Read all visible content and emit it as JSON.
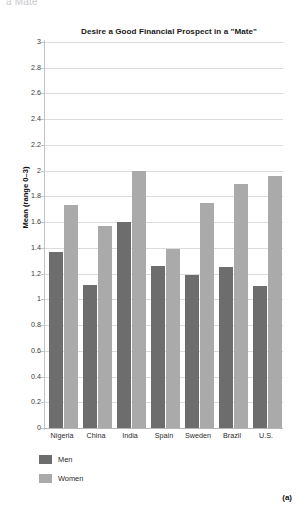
{
  "figure": {
    "cutoff_text": "a Mate",
    "panel_label": "(a)"
  },
  "legend": {
    "position": "bottom-left",
    "items": [
      {
        "label": "Men",
        "color": "#6d6d6d",
        "swatch": "men-color-swatch"
      },
      {
        "label": "Women",
        "color": "#aaaaaa",
        "swatch": "women-color-swatch"
      }
    ]
  },
  "chart_data": {
    "type": "bar",
    "title": "Desire a Good Financial Prospect in a \"Mate\"",
    "subtitle": "",
    "xlabel": "",
    "ylabel": "Mean (range 0–3)",
    "ylim": [
      0,
      3
    ],
    "ytick_step": 0.2,
    "yticks": [
      0,
      0.2,
      0.4,
      0.6,
      0.8,
      1,
      1.2,
      1.4,
      1.6,
      1.8,
      2,
      2.2,
      2.4,
      2.6,
      2.8,
      3
    ],
    "ytick_labels": [
      "0",
      "0.2",
      "0.4",
      "0.6",
      "0.8",
      "1",
      "1.2",
      "1.4",
      "1.6",
      "1.8",
      "2",
      "2.2",
      "2.4",
      "2.6",
      "2.8",
      "3"
    ],
    "grid": true,
    "grid_axis": "y",
    "legend_position": "below-plot-left",
    "categories": [
      "Nigeria",
      "China",
      "India",
      "Spain",
      "Sweden",
      "Brazil",
      "U.S."
    ],
    "series": [
      {
        "name": "Men",
        "color": "#6d6d6d",
        "values": [
          1.37,
          1.11,
          1.6,
          1.26,
          1.19,
          1.25,
          1.1
        ]
      },
      {
        "name": "Women",
        "color": "#aaaaaa",
        "values": [
          1.73,
          1.57,
          2.0,
          1.39,
          1.75,
          1.9,
          1.96
        ]
      }
    ]
  }
}
